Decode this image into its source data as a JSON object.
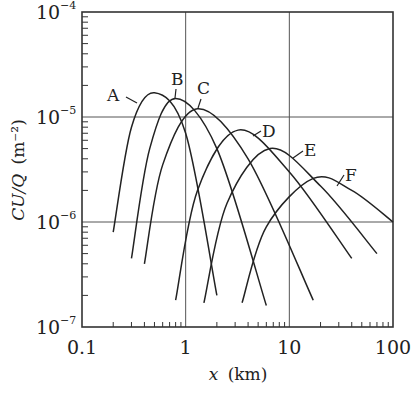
{
  "chart_data": {
    "type": "line",
    "title": "",
    "xlabel": "x (km)",
    "xlabel_var": "x",
    "xlabel_unit": "(km)",
    "ylabel": "CU/Q (m⁻²)",
    "ylabel_main": "CU/Q",
    "ylabel_unit": "(m⁻²)",
    "xscale": "log",
    "yscale": "log",
    "xlim": [
      0.1,
      100
    ],
    "ylim": [
      1e-07,
      0.0001
    ],
    "grid": "major gridlines at decades",
    "x_ticks": [
      {
        "value": 0.1,
        "label": "0.1"
      },
      {
        "value": 1,
        "label": "1"
      },
      {
        "value": 10,
        "label": "10"
      },
      {
        "value": 100,
        "label": "100"
      }
    ],
    "y_ticks": [
      {
        "value": 0.0001,
        "base": "10",
        "exp": "−4"
      },
      {
        "value": 1e-05,
        "base": "10",
        "exp": "−5"
      },
      {
        "value": 1e-06,
        "base": "10",
        "exp": "−6"
      },
      {
        "value": 1e-07,
        "base": "10",
        "exp": "−7"
      }
    ],
    "series": [
      {
        "name": "A",
        "x": [
          0.2,
          0.3,
          0.5,
          1.0,
          2.0
        ],
        "y": [
          8e-07,
          8e-06,
          1.7e-05,
          7e-06,
          2e-07
        ]
      },
      {
        "name": "B",
        "x": [
          0.3,
          0.45,
          0.8,
          2.0,
          6.0
        ],
        "y": [
          4.5e-07,
          5e-06,
          1.5e-05,
          5e-06,
          1.6e-07
        ]
      },
      {
        "name": "C",
        "x": [
          0.4,
          0.6,
          1.3,
          4.0,
          17.0
        ],
        "y": [
          4e-07,
          3.5e-06,
          1.2e-05,
          4e-06,
          1.8e-07
        ]
      },
      {
        "name": "D",
        "x": [
          0.8,
          1.3,
          3.2,
          10.0,
          40.0
        ],
        "y": [
          1.8e-07,
          2e-06,
          7.5e-06,
          3e-06,
          4.5e-07
        ]
      },
      {
        "name": "E",
        "x": [
          1.5,
          2.5,
          6.5,
          20.0,
          70.0
        ],
        "y": [
          1.7e-07,
          1.5e-06,
          5e-06,
          2.2e-06,
          5e-07
        ]
      },
      {
        "name": "F",
        "x": [
          3.5,
          6.0,
          17.0,
          40.0,
          100.0
        ],
        "y": [
          1.7e-07,
          9e-07,
          2.6e-06,
          2e-06,
          1e-06
        ]
      }
    ],
    "legend": "inline labels A–F with leader lines"
  }
}
